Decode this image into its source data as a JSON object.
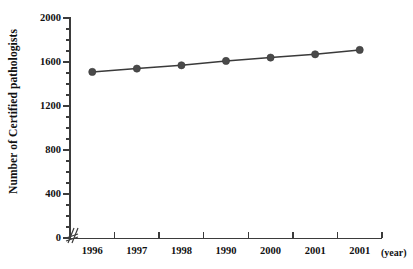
{
  "chart_data": {
    "type": "line",
    "title": "",
    "xlabel": "(year)",
    "ylabel": "Number of Certified pathologists",
    "categories": [
      "1996",
      "1997",
      "1998",
      "1990",
      "2000",
      "2001",
      "2001"
    ],
    "values": [
      1510,
      1540,
      1570,
      1610,
      1640,
      1670,
      1710
    ],
    "series": [
      {
        "name": "Number of Certified pathologists",
        "values": [
          1510,
          1540,
          1570,
          1610,
          1640,
          1670,
          1710
        ]
      }
    ],
    "ylim": [
      0,
      2000
    ],
    "y_ticks": [
      "0",
      "400",
      "800",
      "1200",
      "1600",
      "2000"
    ],
    "y_tick_values": [
      0,
      400,
      800,
      1200,
      1600,
      2000
    ],
    "y_minor_tick_step": 100,
    "grid": false,
    "legend": "none",
    "axis_break": "y-axis break near origin",
    "marker": "filled-circle",
    "colors": {
      "marker": "#4a4a4a",
      "line": "#3a3a3a",
      "axis": "#3b3b3b",
      "text": "#111111",
      "background": "#ffffff"
    }
  },
  "axes": {
    "y_title": "Number of Certified pathologists",
    "x_unit_label": "(year)"
  }
}
